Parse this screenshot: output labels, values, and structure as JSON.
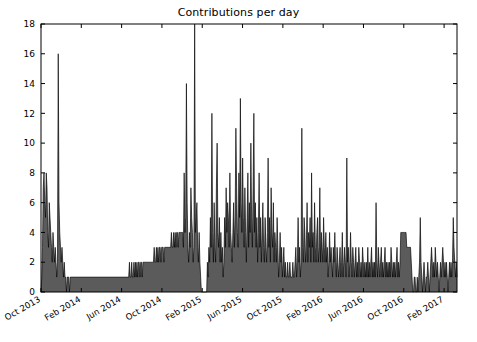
{
  "chart_data": {
    "type": "area",
    "title": "Contributions per day",
    "xlabel": "",
    "ylabel": "",
    "ylim": [
      0,
      18
    ],
    "yticks": [
      0,
      2,
      4,
      6,
      8,
      10,
      12,
      14,
      16,
      18
    ],
    "grid": false,
    "legend": "none",
    "xtick_labels": [
      "Oct 2013",
      "Feb 2014",
      "Jun 2014",
      "Oct 2014",
      "Feb 2015",
      "Jun 2015",
      "Oct 2015",
      "Feb 2016",
      "Jun 2016",
      "Oct 2016",
      "Feb 2017"
    ],
    "xtick_rotation_deg": 30,
    "x_start": "Oct 2013",
    "x_end": "Apr 2017",
    "series": [
      {
        "name": "Contributions per day",
        "fill_color": "#4d4d4d",
        "line_color": "#000000",
        "values": [
          0,
          1,
          3,
          7,
          8,
          6,
          5,
          8,
          7,
          4,
          3,
          6,
          5,
          4,
          3,
          2,
          4,
          3,
          2,
          3,
          2,
          1,
          2,
          16,
          6,
          4,
          3,
          2,
          3,
          2,
          1,
          2,
          1,
          1,
          0,
          1,
          1,
          1,
          0,
          1,
          1,
          1,
          1,
          1,
          1,
          1,
          1,
          1,
          1,
          1,
          1,
          1,
          1,
          1,
          1,
          1,
          1,
          1,
          1,
          1,
          1,
          1,
          1,
          1,
          1,
          1,
          1,
          1,
          1,
          1,
          1,
          1,
          1,
          1,
          1,
          1,
          1,
          1,
          1,
          1,
          1,
          1,
          1,
          1,
          1,
          1,
          1,
          1,
          1,
          1,
          1,
          1,
          1,
          1,
          1,
          1,
          1,
          1,
          1,
          1,
          1,
          1,
          1,
          1,
          1,
          1,
          1,
          1,
          1,
          1,
          1,
          1,
          1,
          1,
          1,
          1,
          1,
          1,
          2,
          1,
          1,
          2,
          1,
          1,
          2,
          1,
          2,
          1,
          2,
          1,
          2,
          2,
          1,
          2,
          2,
          1,
          2,
          2,
          2,
          2,
          2,
          2,
          2,
          2,
          2,
          2,
          2,
          2,
          2,
          2,
          2,
          3,
          2,
          2,
          3,
          2,
          3,
          2,
          3,
          3,
          2,
          3,
          3,
          3,
          2,
          3,
          3,
          3,
          3,
          3,
          3,
          3,
          3,
          3,
          4,
          3,
          3,
          4,
          3,
          4,
          3,
          4,
          4,
          3,
          4,
          4,
          4,
          4,
          4,
          4,
          3,
          8,
          4,
          5,
          14,
          6,
          3,
          2,
          4,
          3,
          7,
          5,
          4,
          2,
          3,
          18,
          4,
          5,
          6,
          3,
          2,
          4,
          2,
          1,
          0,
          0,
          0,
          0,
          0,
          0,
          0,
          0,
          2,
          1,
          3,
          2,
          5,
          3,
          12,
          4,
          2,
          6,
          3,
          2,
          7,
          10,
          4,
          3,
          5,
          2,
          4,
          2,
          3,
          1,
          2,
          5,
          3,
          7,
          4,
          6,
          5,
          3,
          8,
          4,
          3,
          2,
          4,
          6,
          3,
          5,
          11,
          7,
          4,
          3,
          8,
          5,
          13,
          6,
          4,
          9,
          5,
          3,
          7,
          4,
          2,
          5,
          8,
          3,
          6,
          4,
          10,
          5,
          3,
          7,
          12,
          4,
          6,
          3,
          5,
          2,
          4,
          8,
          3,
          5,
          2,
          4,
          6,
          3,
          2,
          5,
          3,
          2,
          4,
          9,
          3,
          5,
          2,
          7,
          4,
          3,
          6,
          2,
          4,
          3,
          2,
          5,
          3,
          1,
          2,
          4,
          2,
          3,
          1,
          2,
          3,
          1,
          2,
          1,
          1,
          2,
          1,
          1,
          2,
          1,
          1,
          1,
          2,
          1,
          1,
          2,
          3,
          1,
          2,
          5,
          2,
          3,
          1,
          2,
          11,
          3,
          2,
          5,
          4,
          2,
          3,
          6,
          2,
          4,
          3,
          5,
          2,
          8,
          3,
          4,
          2,
          6,
          3,
          2,
          4,
          5,
          2,
          3,
          7,
          2,
          4,
          3,
          2,
          5,
          3,
          2,
          4,
          2,
          3,
          1,
          2,
          4,
          2,
          3,
          2,
          1,
          3,
          2,
          4,
          2,
          1,
          3,
          2,
          1,
          2,
          3,
          1,
          2,
          4,
          1,
          2,
          3,
          2,
          1,
          9,
          2,
          3,
          1,
          2,
          4,
          2,
          1,
          3,
          2,
          1,
          2,
          3,
          1,
          2,
          1,
          3,
          2,
          1,
          2,
          1,
          3,
          2,
          1,
          2,
          1,
          2,
          1,
          3,
          1,
          2,
          1,
          2,
          3,
          1,
          2,
          1,
          2,
          1,
          6,
          2,
          1,
          3,
          2,
          1,
          2,
          3,
          1,
          2,
          1,
          2,
          3,
          1,
          2,
          1,
          2,
          1,
          2,
          1,
          3,
          2,
          1,
          2,
          1,
          2,
          1,
          2,
          3,
          1,
          2,
          1,
          2,
          4,
          4,
          4,
          4,
          4,
          4,
          4,
          4,
          3,
          3,
          3,
          3,
          3,
          3,
          2,
          1,
          0,
          0,
          1,
          1,
          0,
          0,
          1,
          0,
          1,
          2,
          5,
          2,
          1,
          0,
          1,
          2,
          1,
          0,
          1,
          1,
          2,
          1,
          0,
          1,
          2,
          3,
          2,
          1,
          2,
          1,
          3,
          2,
          1,
          2,
          1,
          0,
          1,
          2,
          1,
          2,
          3,
          2,
          1,
          2,
          1,
          2,
          1,
          0,
          1,
          2,
          1,
          2,
          1,
          2,
          5,
          3,
          2,
          1,
          2,
          1
        ]
      }
    ],
    "notes": [
      "Tall early spike of 16 near Oct 2013",
      "Sustained low plateau (~1-4) through 2014 rising slowly",
      "Maximum spike of 18 (clipped at axis top) near Feb 2015",
      "Dense high-frequency spikes 12-13 through Jun 2015 - Feb 2016",
      "Declining activity through 2016-2017 mostly 0-5"
    ]
  },
  "axes": {
    "top_spine": true,
    "right_spine": true,
    "bottom_spine": true,
    "left_spine": true
  }
}
